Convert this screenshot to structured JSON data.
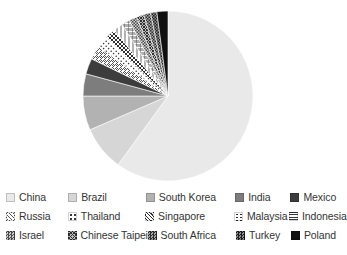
{
  "chart_data": {
    "type": "pie",
    "title": "",
    "subtitle": "",
    "xlabel": "",
    "ylabel": "",
    "grid": false,
    "legend_position": "bottom",
    "start_angle_deg": 0,
    "direction": "clockwise",
    "categories": [
      "China",
      "Brazil",
      "South Korea",
      "India",
      "Mexico",
      "Russia",
      "Thailand",
      "Singapore",
      "Malaysia",
      "Indonesia",
      "Israel",
      "Chinese Taipei",
      "South Africa",
      "Turkey",
      "Poland"
    ],
    "values": [
      60.0,
      8.5,
      6.5,
      4.2,
      3.0,
      2.6,
      2.3,
      2.0,
      1.8,
      1.6,
      1.5,
      1.4,
      1.3,
      1.2,
      2.1
    ],
    "slices": [
      {
        "label": "China",
        "value": 60.0,
        "fill": "#e9e9e9",
        "pattern": "solid"
      },
      {
        "label": "Brazil",
        "value": 8.5,
        "fill": "#d6d6d6",
        "pattern": "solid"
      },
      {
        "label": "South Korea",
        "value": 6.5,
        "fill": "#b2b2b2",
        "pattern": "solid"
      },
      {
        "label": "India",
        "value": 4.2,
        "fill": "#7d7d7d",
        "pattern": "solid"
      },
      {
        "label": "Mexico",
        "value": 3.0,
        "fill": "#3d3d3d",
        "pattern": "solid"
      },
      {
        "label": "Russia",
        "value": 2.6,
        "fill": "#ffffff",
        "pattern": "diagonal-hatch"
      },
      {
        "label": "Thailand",
        "value": 2.3,
        "fill": "#ffffff",
        "pattern": "sparse-dots"
      },
      {
        "label": "Singapore",
        "value": 2.0,
        "fill": "#ffffff",
        "pattern": "dense-cross"
      },
      {
        "label": "Malaysia",
        "value": 1.8,
        "fill": "#ffffff",
        "pattern": "vertical-dots"
      },
      {
        "label": "Indonesia",
        "value": 1.6,
        "fill": "#ffffff",
        "pattern": "grid-mixed"
      },
      {
        "label": "Israel",
        "value": 1.5,
        "fill": "#9a9a9a",
        "pattern": "checker"
      },
      {
        "label": "Chinese Taipei",
        "value": 1.4,
        "fill": "#8a8a8a",
        "pattern": "dense-cross"
      },
      {
        "label": "South Africa",
        "value": 1.3,
        "fill": "#707070",
        "pattern": "checker"
      },
      {
        "label": "Turkey",
        "value": 1.2,
        "fill": "#5a5a5a",
        "pattern": "checker"
      },
      {
        "label": "Poland",
        "value": 2.1,
        "fill": "#111111",
        "pattern": "solid"
      }
    ]
  },
  "legend": {
    "rows": [
      [
        {
          "label": "China",
          "swatch": "solid-lightest"
        },
        {
          "label": "Brazil",
          "swatch": "solid-light"
        },
        {
          "label": "South Korea",
          "swatch": "solid-medium"
        },
        {
          "label": "India",
          "swatch": "solid-dark"
        },
        {
          "label": "Mexico",
          "swatch": "solid-darker"
        }
      ],
      [
        {
          "label": "Russia",
          "swatch": "diagonal-hatch"
        },
        {
          "label": "Thailand",
          "swatch": "sparse-dots"
        },
        {
          "label": "Singapore",
          "swatch": "dense-cross"
        },
        {
          "label": "Malaysia",
          "swatch": "vertical-dots"
        },
        {
          "label": "Indonesia",
          "swatch": "grid-mixed"
        }
      ],
      [
        {
          "label": "Israel",
          "swatch": "checker-mid"
        },
        {
          "label": "Chinese Taipei",
          "swatch": "dense-cross-dark"
        },
        {
          "label": "South Africa",
          "swatch": "checker-dark"
        },
        {
          "label": "Turkey",
          "swatch": "checker-darker"
        },
        {
          "label": "Poland",
          "swatch": "solid-black"
        }
      ]
    ]
  },
  "colors": {
    "background": "#ffffff",
    "text": "#343434",
    "lightest": "#e9e9e9",
    "light": "#d6d6d6",
    "medium": "#b2b2b2",
    "dark": "#7d7d7d",
    "darker": "#3d3d3d",
    "black": "#111111"
  }
}
